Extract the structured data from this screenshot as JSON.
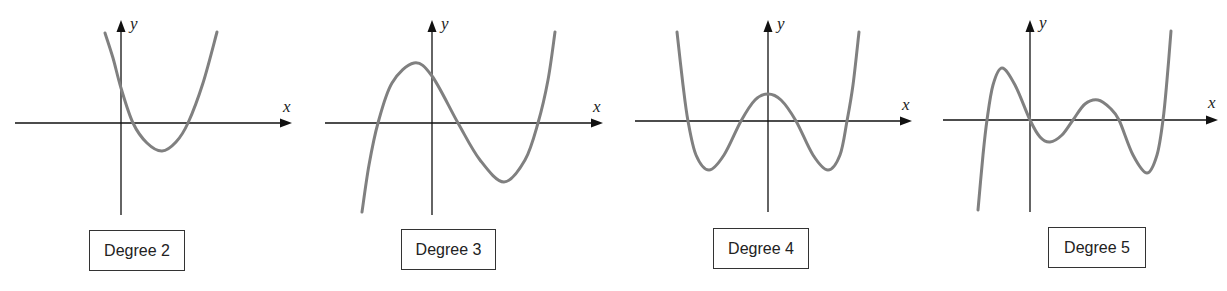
{
  "figure": {
    "curve_color": "#808080",
    "axis_color": "#111111",
    "axis_labels": {
      "x": "x",
      "y": "y"
    }
  },
  "graphs": [
    {
      "label": "Degree 2",
      "degree": 2,
      "box": {
        "x": 89,
        "y": 230,
        "w": 96,
        "h": 41
      },
      "x_axis": {
        "x1": 15,
        "x2": 292,
        "y": 123
      },
      "y_axis": {
        "x": 121,
        "y1": 215,
        "y2": 20
      },
      "x_label_pos": [
        283,
        112
      ],
      "y_label_pos": [
        130,
        29
      ],
      "curve_points": [
        [
          105,
          33
        ],
        [
          113,
          58
        ],
        [
          121,
          88
        ],
        [
          133,
          123
        ],
        [
          147,
          143
        ],
        [
          162,
          151
        ],
        [
          176,
          142
        ],
        [
          188,
          123
        ],
        [
          203,
          83
        ],
        [
          217,
          32
        ]
      ]
    },
    {
      "label": "Degree 3",
      "degree": 3,
      "box": {
        "x": 401,
        "y": 229,
        "w": 95,
        "h": 41
      },
      "x_axis": {
        "x1": 325,
        "x2": 603,
        "y": 123
      },
      "y_axis": {
        "x": 432,
        "y1": 215,
        "y2": 20
      },
      "x_label_pos": [
        593,
        112
      ],
      "y_label_pos": [
        441,
        29
      ],
      "curve_points": [
        [
          362,
          212
        ],
        [
          369,
          165
        ],
        [
          378,
          123
        ],
        [
          392,
          83
        ],
        [
          414,
          63
        ],
        [
          432,
          76
        ],
        [
          458,
          123
        ],
        [
          480,
          160
        ],
        [
          504,
          182
        ],
        [
          525,
          160
        ],
        [
          538,
          123
        ],
        [
          548,
          80
        ],
        [
          555,
          32
        ]
      ]
    },
    {
      "label": "Degree 4",
      "degree": 4,
      "box": {
        "x": 713,
        "y": 228,
        "w": 96,
        "h": 41
      },
      "x_axis": {
        "x1": 635,
        "x2": 912,
        "y": 121
      },
      "y_axis": {
        "x": 768,
        "y1": 212,
        "y2": 20
      },
      "x_label_pos": [
        902,
        110
      ],
      "y_label_pos": [
        777,
        29
      ],
      "curve_points": [
        [
          677,
          32
        ],
        [
          683,
          85
        ],
        [
          688,
          121
        ],
        [
          696,
          155
        ],
        [
          709,
          170
        ],
        [
          724,
          155
        ],
        [
          741,
          121
        ],
        [
          755,
          100
        ],
        [
          768,
          94
        ],
        [
          781,
          100
        ],
        [
          796,
          121
        ],
        [
          813,
          155
        ],
        [
          828,
          170
        ],
        [
          840,
          155
        ],
        [
          847,
          121
        ],
        [
          853,
          85
        ],
        [
          859,
          32
        ]
      ]
    },
    {
      "label": "Degree 5",
      "degree": 5,
      "box": {
        "x": 1048,
        "y": 227,
        "w": 98,
        "h": 41
      },
      "x_axis": {
        "x1": 943,
        "x2": 1218,
        "y": 120
      },
      "y_axis": {
        "x": 1030,
        "y1": 212,
        "y2": 20
      },
      "x_label_pos": [
        1208,
        108
      ],
      "y_label_pos": [
        1039,
        28
      ],
      "curve_points": [
        [
          978,
          210
        ],
        [
          983,
          155
        ],
        [
          987,
          120
        ],
        [
          993,
          85
        ],
        [
          1002,
          68
        ],
        [
          1015,
          85
        ],
        [
          1030,
          120
        ],
        [
          1040,
          137
        ],
        [
          1050,
          142
        ],
        [
          1062,
          135
        ],
        [
          1073,
          120
        ],
        [
          1085,
          104
        ],
        [
          1098,
          100
        ],
        [
          1110,
          108
        ],
        [
          1119,
          120
        ],
        [
          1133,
          155
        ],
        [
          1147,
          173
        ],
        [
          1157,
          155
        ],
        [
          1163,
          120
        ],
        [
          1167,
          80
        ],
        [
          1171,
          31
        ]
      ]
    }
  ],
  "chart_data": [
    {
      "type": "line",
      "title": "Degree 2",
      "xlabel": "x",
      "ylabel": "y",
      "shape": "parabola opening upward; y-intercept positive; two positive real roots; one minimum",
      "turning_points": 1,
      "real_roots": 2,
      "grid": false
    },
    {
      "type": "line",
      "title": "Degree 3",
      "xlabel": "x",
      "ylabel": "y",
      "shape": "cubic rising from bottom-left to top-right; local max left of y-axis, local min right of y-axis",
      "turning_points": 2,
      "real_roots": 3,
      "grid": false
    },
    {
      "type": "line",
      "title": "Degree 4",
      "xlabel": "x",
      "ylabel": "y",
      "shape": "symmetric W shape; local max on y-axis above x-axis; two local minima below x-axis",
      "turning_points": 3,
      "real_roots": 4,
      "grid": false
    },
    {
      "type": "line",
      "title": "Degree 5",
      "xlabel": "x",
      "ylabel": "y",
      "shape": "quintic rising from bottom-left to top-right; passes through origin; two local maxima and two local minima",
      "turning_points": 4,
      "real_roots": 5,
      "grid": false
    }
  ]
}
